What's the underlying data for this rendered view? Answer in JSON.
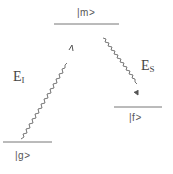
{
  "diagram": {
    "title": "",
    "levels": [
      {
        "id": "m",
        "label": "|m>",
        "x1": 54,
        "x2": 119,
        "y": 24
      },
      {
        "id": "g",
        "label": "|g>",
        "x1": 3,
        "x2": 52,
        "y": 142
      },
      {
        "id": "f",
        "label": "|f>",
        "x1": 114,
        "x2": 162,
        "y": 107
      }
    ],
    "transitions": [
      {
        "id": "excitation",
        "label_main": "E",
        "label_sub": "I",
        "from": "g",
        "to": "m",
        "style": "wavy-arrow"
      },
      {
        "id": "emission",
        "label_main": "E",
        "label_sub": "S",
        "from": "m",
        "to": "f",
        "style": "wavy-arrow"
      }
    ],
    "colors": {
      "line": "#666666",
      "text": "#555555"
    }
  }
}
